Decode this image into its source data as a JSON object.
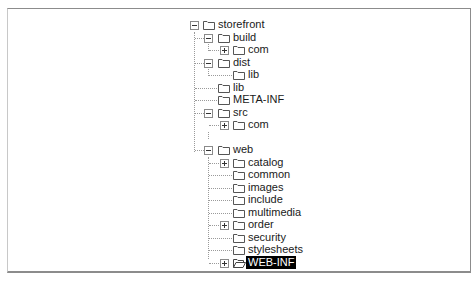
{
  "tree": {
    "nodes": [
      {
        "label": "storefront",
        "level": 0,
        "expander": "minus",
        "selected": false
      },
      {
        "label": "build",
        "level": 1,
        "expander": "minus",
        "selected": false
      },
      {
        "label": "com",
        "level": 2,
        "expander": "plus",
        "selected": false
      },
      {
        "label": "dist",
        "level": 1,
        "expander": "minus",
        "selected": false
      },
      {
        "label": "lib",
        "level": 2,
        "expander": "none",
        "selected": false
      },
      {
        "label": "lib",
        "level": 1,
        "expander": "none",
        "selected": false
      },
      {
        "label": "META-INF",
        "level": 1,
        "expander": "none",
        "selected": false
      },
      {
        "label": "src",
        "level": 1,
        "expander": "minus",
        "selected": false
      },
      {
        "label": "com",
        "level": 2,
        "expander": "plus",
        "selected": false
      },
      {
        "label": "web",
        "level": 1,
        "expander": "minus",
        "selected": false
      },
      {
        "label": "catalog",
        "level": 2,
        "expander": "plus",
        "selected": false
      },
      {
        "label": "common",
        "level": 2,
        "expander": "none",
        "selected": false
      },
      {
        "label": "images",
        "level": 2,
        "expander": "none",
        "selected": false
      },
      {
        "label": "include",
        "level": 2,
        "expander": "none",
        "selected": false
      },
      {
        "label": "multimedia",
        "level": 2,
        "expander": "none",
        "selected": false
      },
      {
        "label": "order",
        "level": 2,
        "expander": "plus",
        "selected": false
      },
      {
        "label": "security",
        "level": 2,
        "expander": "none",
        "selected": false
      },
      {
        "label": "stylesheets",
        "level": 2,
        "expander": "none",
        "selected": false
      },
      {
        "label": "WEB-INF",
        "level": 2,
        "expander": "plus",
        "selected": true
      }
    ]
  },
  "colors": {
    "selection_bg": "#000000",
    "selection_fg": "#ffffff",
    "connector": "#9a9a9a",
    "frame": "#8c8c8c"
  },
  "icons": {
    "folder": "folder-icon",
    "folder_open": "folder-open-icon",
    "expand": "plus-box-icon",
    "collapse": "minus-box-icon"
  }
}
